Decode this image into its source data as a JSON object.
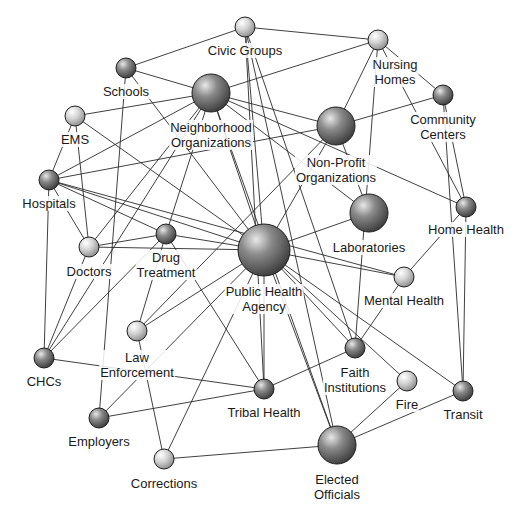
{
  "diagram": {
    "colors": {
      "background": "#ffffff",
      "edge": "#2a2a2a",
      "node_light": "#e6e6e6",
      "node_dark": "#5a5a5a",
      "label": "#1a1a1a"
    },
    "nodes": [
      {
        "id": "civic",
        "label": "Civic Groups",
        "x": 245,
        "y": 27,
        "r": 10,
        "shade": "light",
        "lx": 245,
        "ly": 43
      },
      {
        "id": "nursing",
        "label": "Nursing\nHomes",
        "x": 378,
        "y": 40,
        "r": 10,
        "shade": "light",
        "lx": 395,
        "ly": 57
      },
      {
        "id": "schools",
        "label": "Schools",
        "x": 126,
        "y": 68,
        "r": 10,
        "shade": "dark",
        "lx": 126,
        "ly": 84
      },
      {
        "id": "neighborhood",
        "label": "Neighborhood\nOrganizations",
        "x": 211,
        "y": 93,
        "r": 19,
        "shade": "dark",
        "lx": 211,
        "ly": 120
      },
      {
        "id": "community",
        "label": "Community\nCenters",
        "x": 443,
        "y": 95,
        "r": 10,
        "shade": "dark",
        "lx": 443,
        "ly": 112
      },
      {
        "id": "nonprofit",
        "label": "Non-Profit\nOrganizations",
        "x": 336,
        "y": 126,
        "r": 19,
        "shade": "dark",
        "lx": 336,
        "ly": 155
      },
      {
        "id": "ems",
        "label": "EMS",
        "x": 75,
        "y": 116,
        "r": 10,
        "shade": "light",
        "lx": 75,
        "ly": 132
      },
      {
        "id": "hospitals",
        "label": "Hospitals",
        "x": 49,
        "y": 180,
        "r": 10,
        "shade": "dark",
        "lx": 49,
        "ly": 196
      },
      {
        "id": "laboratories",
        "label": "Laboratories",
        "x": 369,
        "y": 213,
        "r": 19,
        "shade": "dark",
        "lx": 369,
        "ly": 240
      },
      {
        "id": "homehealth",
        "label": "Home Health",
        "x": 466,
        "y": 207,
        "r": 10,
        "shade": "dark",
        "lx": 466,
        "ly": 222
      },
      {
        "id": "doctors",
        "label": "Doctors",
        "x": 89,
        "y": 247,
        "r": 10,
        "shade": "light",
        "lx": 89,
        "ly": 264
      },
      {
        "id": "drug",
        "label": "Drug\nTreatment",
        "x": 166,
        "y": 234,
        "r": 10,
        "shade": "dark",
        "lx": 166,
        "ly": 250
      },
      {
        "id": "pha",
        "label": "Public Health\nAgency",
        "x": 264,
        "y": 250,
        "r": 26,
        "shade": "dark",
        "lx": 264,
        "ly": 284
      },
      {
        "id": "mental",
        "label": "Mental Health",
        "x": 404,
        "y": 277,
        "r": 10,
        "shade": "light",
        "lx": 404,
        "ly": 293
      },
      {
        "id": "law",
        "label": "Law\nEnforcement",
        "x": 137,
        "y": 331,
        "r": 10,
        "shade": "light",
        "lx": 137,
        "ly": 350
      },
      {
        "id": "faith",
        "label": "Faith\nInstitutions",
        "x": 355,
        "y": 348,
        "r": 10,
        "shade": "dark",
        "lx": 355,
        "ly": 365
      },
      {
        "id": "chcs",
        "label": "CHCs",
        "x": 44,
        "y": 358,
        "r": 10,
        "shade": "dark",
        "lx": 44,
        "ly": 374
      },
      {
        "id": "fire",
        "label": "Fire",
        "x": 407,
        "y": 381,
        "r": 10,
        "shade": "light",
        "lx": 407,
        "ly": 397
      },
      {
        "id": "tribal",
        "label": "Tribal Health",
        "x": 264,
        "y": 389,
        "r": 10,
        "shade": "dark",
        "lx": 264,
        "ly": 405
      },
      {
        "id": "transit",
        "label": "Transit",
        "x": 463,
        "y": 391,
        "r": 10,
        "shade": "dark",
        "lx": 463,
        "ly": 407
      },
      {
        "id": "employers",
        "label": "Employers",
        "x": 99,
        "y": 418,
        "r": 10,
        "shade": "dark",
        "lx": 99,
        "ly": 434
      },
      {
        "id": "elected",
        "label": "Elected\nOfficials",
        "x": 337,
        "y": 445,
        "r": 19,
        "shade": "dark",
        "lx": 337,
        "ly": 472
      },
      {
        "id": "corrections",
        "label": "Corrections",
        "x": 164,
        "y": 459,
        "r": 10,
        "shade": "light",
        "lx": 164,
        "ly": 476
      }
    ],
    "edges": [
      [
        "civic",
        "schools"
      ],
      [
        "civic",
        "nursing"
      ],
      [
        "civic",
        "faith"
      ],
      [
        "civic",
        "elected"
      ],
      [
        "civic",
        "pha"
      ],
      [
        "civic",
        "tribal"
      ],
      [
        "nursing",
        "neighborhood"
      ],
      [
        "nursing",
        "nonprofit"
      ],
      [
        "nursing",
        "community"
      ],
      [
        "nursing",
        "homehealth"
      ],
      [
        "nursing",
        "faith"
      ],
      [
        "schools",
        "neighborhood"
      ],
      [
        "schools",
        "pha"
      ],
      [
        "schools",
        "employers"
      ],
      [
        "neighborhood",
        "ems"
      ],
      [
        "neighborhood",
        "hospitals"
      ],
      [
        "neighborhood",
        "nonprofit"
      ],
      [
        "neighborhood",
        "pha"
      ],
      [
        "neighborhood",
        "drug"
      ],
      [
        "neighborhood",
        "doctors"
      ],
      [
        "neighborhood",
        "chcs"
      ],
      [
        "neighborhood",
        "laboratories"
      ],
      [
        "neighborhood",
        "homehealth"
      ],
      [
        "neighborhood",
        "elected"
      ],
      [
        "community",
        "nonprofit"
      ],
      [
        "community",
        "homehealth"
      ],
      [
        "community",
        "transit"
      ],
      [
        "nonprofit",
        "hospitals"
      ],
      [
        "nonprofit",
        "pha"
      ],
      [
        "nonprofit",
        "laboratories"
      ],
      [
        "nonprofit",
        "law"
      ],
      [
        "ems",
        "hospitals"
      ],
      [
        "ems",
        "doctors"
      ],
      [
        "ems",
        "pha"
      ],
      [
        "hospitals",
        "doctors"
      ],
      [
        "hospitals",
        "drug"
      ],
      [
        "hospitals",
        "pha"
      ],
      [
        "hospitals",
        "chcs"
      ],
      [
        "hospitals",
        "mental"
      ],
      [
        "laboratories",
        "pha"
      ],
      [
        "homehealth",
        "mental"
      ],
      [
        "homehealth",
        "transit"
      ],
      [
        "doctors",
        "drug"
      ],
      [
        "doctors",
        "pha"
      ],
      [
        "doctors",
        "chcs"
      ],
      [
        "drug",
        "pha"
      ],
      [
        "drug",
        "law"
      ],
      [
        "drug",
        "tribal"
      ],
      [
        "drug",
        "chcs"
      ],
      [
        "pha",
        "mental"
      ],
      [
        "pha",
        "faith"
      ],
      [
        "pha",
        "fire"
      ],
      [
        "pha",
        "tribal"
      ],
      [
        "pha",
        "transit"
      ],
      [
        "pha",
        "elected"
      ],
      [
        "pha",
        "law"
      ],
      [
        "pha",
        "employers"
      ],
      [
        "pha",
        "corrections"
      ],
      [
        "mental",
        "faith"
      ],
      [
        "law",
        "corrections"
      ],
      [
        "chcs",
        "tribal"
      ],
      [
        "faith",
        "tribal"
      ],
      [
        "fire",
        "elected"
      ],
      [
        "tribal",
        "employers"
      ],
      [
        "transit",
        "elected"
      ],
      [
        "elected",
        "corrections"
      ]
    ]
  }
}
